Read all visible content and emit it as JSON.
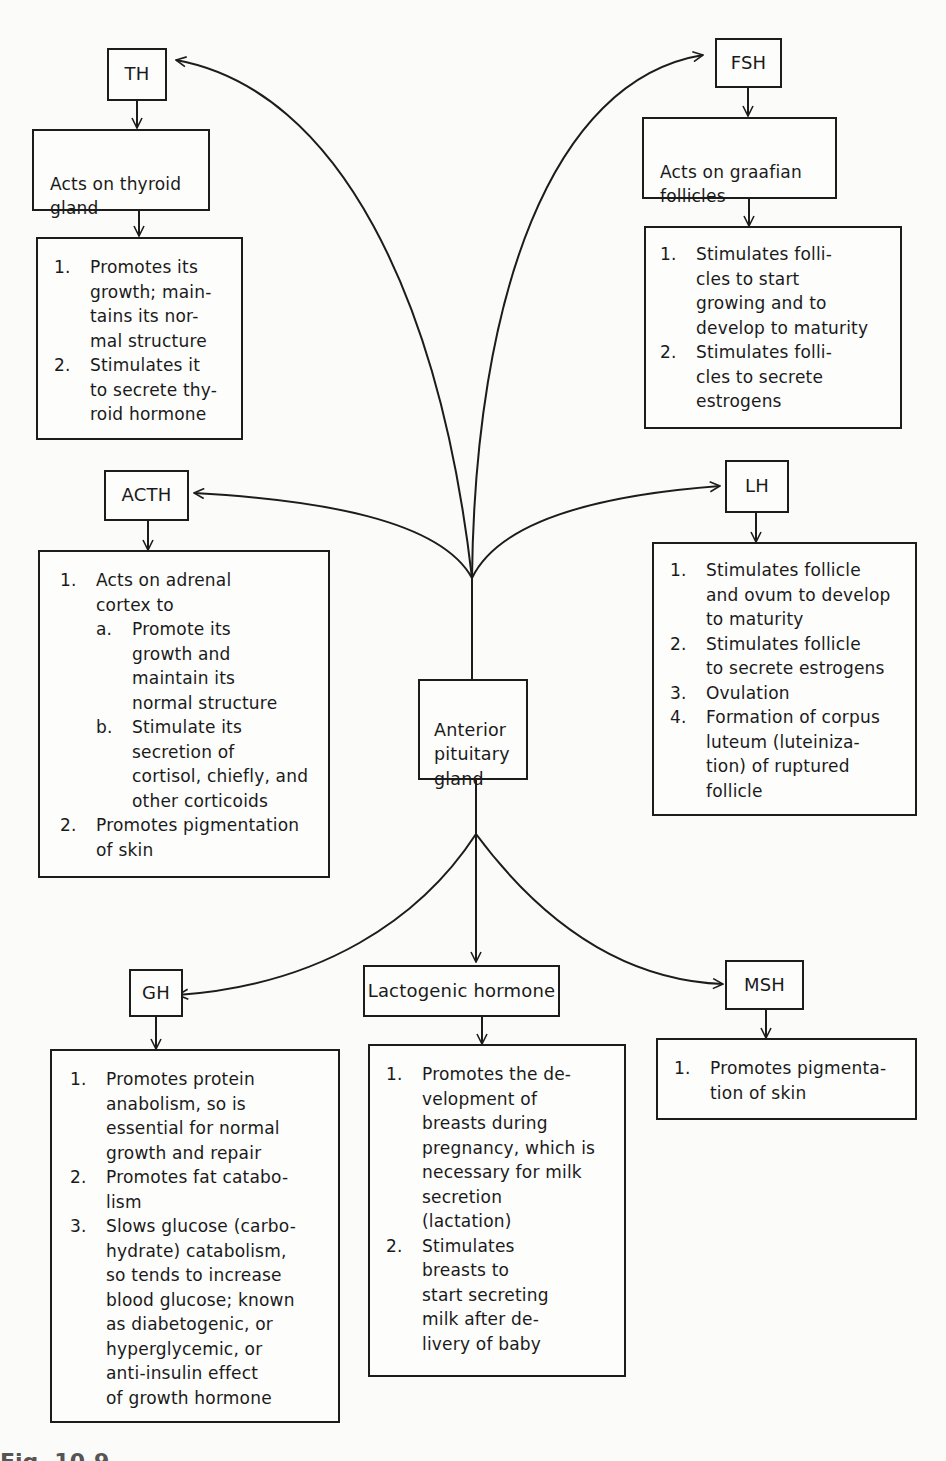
{
  "center": {
    "label": "Anterior\npituitary\ngland"
  },
  "hormones": {
    "th": {
      "label": "TH",
      "target": "Acts on thyroid\ngland",
      "effects": [
        {
          "num": "1.",
          "text": "Promotes its\ngrowth; main-\ntains its nor-\nmal structure"
        },
        {
          "num": "2.",
          "text": "Stimulates it\nto secrete thy-\nroid hormone"
        }
      ]
    },
    "fsh": {
      "label": "FSH",
      "target": "Acts on graafian\nfollicles",
      "effects": [
        {
          "num": "1.",
          "text": "Stimulates folli-\ncles to start\ngrowing and to\ndevelop to maturity"
        },
        {
          "num": "2.",
          "text": "Stimulates folli-\ncles to secrete\nestrogens"
        }
      ]
    },
    "acth": {
      "label": "ACTH",
      "effects": [
        {
          "num": "1.",
          "text": "Acts on adrenal\ncortex to"
        },
        {
          "num": "a.",
          "text": "Promote its\ngrowth and\nmaintain its\nnormal structure"
        },
        {
          "num": "b.",
          "text": "Stimulate its\nsecretion of\ncortisol, chiefly, and\nother corticoids"
        },
        {
          "num": "2.",
          "text": "Promotes pigmentation\nof skin"
        }
      ]
    },
    "lh": {
      "label": "LH",
      "effects": [
        {
          "num": "1.",
          "text": "Stimulates follicle\nand ovum to develop\nto maturity"
        },
        {
          "num": "2.",
          "text": "Stimulates follicle\nto secrete estrogens"
        },
        {
          "num": "3.",
          "text": "Ovulation"
        },
        {
          "num": "4.",
          "text": "Formation of corpus\nluteum (luteiniza-\ntion) of ruptured\nfollicle"
        }
      ]
    },
    "gh": {
      "label": "GH",
      "effects": [
        {
          "num": "1.",
          "text": "Promotes protein\nanabolism, so is\nessential for normal\ngrowth and repair"
        },
        {
          "num": "2.",
          "text": "Promotes fat catabo-\nlism"
        },
        {
          "num": "3.",
          "text": "Slows glucose (carbo-\nhydrate) catabolism,\nso tends to increase\nblood glucose; known\nas diabetogenic, or\nhyperglycemic, or\nanti-insulin effect\nof growth hormone"
        }
      ]
    },
    "lactogenic": {
      "label": "Lactogenic hormone",
      "effects": [
        {
          "num": "1.",
          "text": "Promotes the de-\nvelopment of\nbreasts during\npregnancy, which is\nnecessary for milk\nsecretion\n(lactation)"
        },
        {
          "num": "2.",
          "text": "Stimulates\nbreasts to\nstart secreting\nmilk after de-\nlivery of baby"
        }
      ]
    },
    "msh": {
      "label": "MSH",
      "effects": [
        {
          "num": "1.",
          "text": "Promotes pigmenta-\ntion of skin"
        }
      ]
    }
  },
  "caption": "Fig. 10-9"
}
